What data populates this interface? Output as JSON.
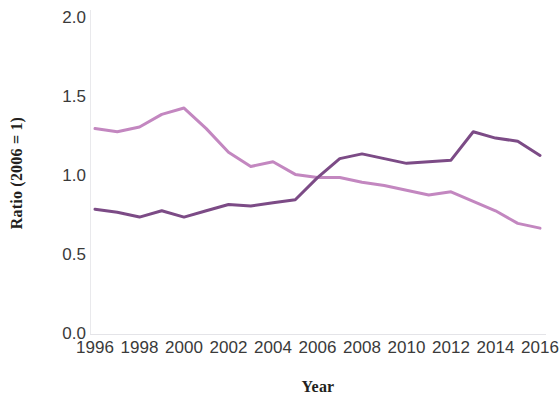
{
  "chart_data": {
    "type": "line",
    "title": "",
    "xlabel": "Year",
    "ylabel": "Ratio (2006 = 1)",
    "xlim": [
      1996,
      2016
    ],
    "ylim": [
      0.0,
      2.0
    ],
    "grid": false,
    "legend": "none",
    "x_tick_labels": [
      "1996",
      "1998",
      "2000",
      "2002",
      "2004",
      "2006",
      "2008",
      "2010",
      "2012",
      "2014",
      "2016"
    ],
    "y_tick_labels": [
      "0.0",
      "0.5",
      "1.0",
      "1.5",
      "2.0"
    ],
    "x": [
      1996,
      1997,
      1998,
      1999,
      2000,
      2001,
      2002,
      2003,
      2004,
      2005,
      2006,
      2007,
      2008,
      2009,
      2010,
      2011,
      2012,
      2013,
      2014,
      2015,
      2016
    ],
    "series": [
      {
        "name": "light-pink-series",
        "color": "#c387c0",
        "values": [
          1.3,
          1.28,
          1.31,
          1.39,
          1.43,
          1.3,
          1.15,
          1.06,
          1.09,
          1.01,
          0.99,
          0.99,
          0.96,
          0.94,
          0.91,
          0.88,
          0.9,
          0.84,
          0.78,
          0.7,
          0.67
        ]
      },
      {
        "name": "dark-purple-series",
        "color": "#7c4b86",
        "values": [
          0.79,
          0.77,
          0.74,
          0.78,
          0.74,
          0.78,
          0.82,
          0.81,
          0.83,
          0.85,
          0.99,
          1.11,
          1.14,
          1.11,
          1.08,
          1.09,
          1.1,
          1.28,
          1.24,
          1.22,
          1.13
        ]
      }
    ]
  },
  "axis": {
    "y_title": "Ratio (2006 = 1)",
    "x_title": "Year"
  }
}
